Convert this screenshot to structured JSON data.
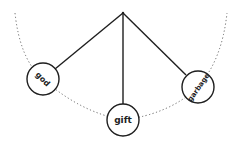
{
  "diagram": {
    "type": "pendulum",
    "pivot": {
      "x": 123,
      "y": 13
    },
    "arc": {
      "style": "dotted",
      "color": "#555555"
    },
    "line_color": "#1e1e1e",
    "nodes": [
      {
        "label": "god",
        "cx": 43,
        "cy": 79,
        "r": 16,
        "rotate": 45
      },
      {
        "label": "gift",
        "cx": 123,
        "cy": 120,
        "r": 16,
        "rotate": 0
      },
      {
        "label": "garbage",
        "cx": 198,
        "cy": 87,
        "r": 16,
        "rotate": -55
      }
    ]
  }
}
